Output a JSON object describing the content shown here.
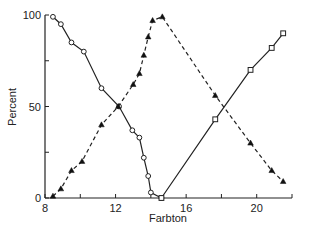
{
  "chart_data": {
    "type": "line",
    "title": "",
    "xlabel": "Farbton",
    "ylabel": "Percent",
    "xlim": [
      8,
      22
    ],
    "ylim": [
      0,
      100
    ],
    "x_ticks": [
      8,
      10,
      12,
      14,
      16,
      18,
      20,
      22
    ],
    "x_tick_labels": [
      "8",
      "",
      "12",
      "",
      "16",
      "",
      "20",
      ""
    ],
    "y_ticks": [
      0,
      25,
      50,
      75,
      100
    ],
    "y_tick_labels": [
      "0",
      "",
      "50",
      "",
      "100"
    ],
    "grid": false,
    "legend": null,
    "series": [
      {
        "name": "open-circle-solid",
        "marker": "circle-open",
        "line": "solid",
        "x": [
          8.45,
          8.9,
          9.5,
          10.2,
          11.2,
          12.2,
          12.95,
          13.35,
          13.6,
          13.85,
          14.0,
          14.6
        ],
        "y": [
          99,
          95,
          85,
          80,
          60,
          50,
          37,
          33,
          22,
          12,
          3,
          0
        ]
      },
      {
        "name": "filled-triangle-dashed",
        "marker": "triangle-filled",
        "line": "dashed",
        "x": [
          8.45,
          8.9,
          9.5,
          10.1,
          11.2,
          12.15,
          13.0,
          13.35,
          13.6,
          13.85,
          14.1,
          14.65,
          17.65,
          19.65,
          20.85,
          21.5
        ],
        "y": [
          1,
          5,
          15,
          20,
          40,
          50,
          62,
          68,
          78,
          88,
          97,
          99,
          56,
          30,
          15,
          9
        ]
      },
      {
        "name": "open-square-solid",
        "marker": "square-open",
        "line": "solid",
        "x": [
          14.6,
          17.65,
          19.65,
          20.85,
          21.5
        ],
        "y": [
          0,
          43,
          70,
          82,
          90
        ]
      }
    ]
  }
}
